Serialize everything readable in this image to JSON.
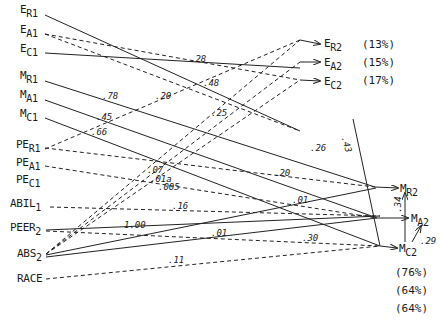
{
  "diagram": {
    "type": "path-diagram",
    "left_nodes": [
      {
        "id": "ER1",
        "base": "E",
        "sub": "R1",
        "x": 20,
        "y": 10
      },
      {
        "id": "EA1",
        "base": "E",
        "sub": "A1",
        "x": 20,
        "y": 30
      },
      {
        "id": "EC1",
        "base": "E",
        "sub": "C1",
        "x": 20,
        "y": 49
      },
      {
        "id": "MR1",
        "base": "M",
        "sub": "R1",
        "x": 20,
        "y": 76
      },
      {
        "id": "MA1",
        "base": "M",
        "sub": "A1",
        "x": 20,
        "y": 95
      },
      {
        "id": "MC1",
        "base": "M",
        "sub": "C1",
        "x": 20,
        "y": 114
      },
      {
        "id": "PER1",
        "base": "PE",
        "sub": "R1",
        "x": 16,
        "y": 145
      },
      {
        "id": "PEA1",
        "base": "PE",
        "sub": "A1",
        "x": 16,
        "y": 163
      },
      {
        "id": "PEC1",
        "base": "PE",
        "sub": "C1",
        "x": 16,
        "y": 180
      },
      {
        "id": "ABIL1",
        "base": "ABIL",
        "sub": "1",
        "x": 10,
        "y": 203
      },
      {
        "id": "PEER2",
        "base": "PEER",
        "sub": "2",
        "x": 10,
        "y": 228
      },
      {
        "id": "ABS2",
        "base": "ABS",
        "sub": "2",
        "x": 17,
        "y": 253
      },
      {
        "id": "RACE",
        "base": "RACE",
        "sub": "",
        "x": 17,
        "y": 276
      }
    ],
    "right_nodes": [
      {
        "id": "ER2",
        "base": "E",
        "sub": "R2",
        "x": 324,
        "y": 39,
        "variance": "(13%)"
      },
      {
        "id": "EA2",
        "base": "E",
        "sub": "A2",
        "x": 324,
        "y": 58,
        "variance": "(15%)"
      },
      {
        "id": "EC2",
        "base": "E",
        "sub": "C2",
        "x": 324,
        "y": 77,
        "variance": "(17%)"
      },
      {
        "id": "MR2",
        "base": "M",
        "sub": "R2",
        "x": 400,
        "y": 185
      },
      {
        "id": "MA2",
        "base": "M",
        "sub": "A2",
        "x": 410,
        "y": 214
      },
      {
        "id": "MC2",
        "base": "M",
        "sub": "C2",
        "x": 399,
        "y": 245
      }
    ],
    "variance_explained": {
      "E": [
        "(13%)",
        "(15%)",
        "(17%)"
      ],
      "M": [
        "(76%)",
        "(64%)",
        "(64%)"
      ]
    },
    "coefficients": [
      {
        "label": ".28",
        "x": 197,
        "y": 59
      },
      {
        "label": ".48",
        "x": 205,
        "y": 80
      },
      {
        "label": ".20",
        "x": 157,
        "y": 92
      },
      {
        "label": ".78",
        "x": 103,
        "y": 93
      },
      {
        "label": ".25",
        "x": 213,
        "y": 110
      },
      {
        "label": ".45",
        "x": 97,
        "y": 113
      },
      {
        "label": ".66",
        "x": 91,
        "y": 129
      },
      {
        "label": ".26",
        "x": 313,
        "y": 146
      },
      {
        "label": ".07",
        "x": 148,
        "y": 167
      },
      {
        "label": ".01a",
        "x": 151,
        "y": 175
      },
      {
        "label": ".005",
        "x": 160,
        "y": 184
      },
      {
        "label": ".20",
        "x": 276,
        "y": 170
      },
      {
        "label": ".16",
        "x": 174,
        "y": 204
      },
      {
        "label": "1.00",
        "x": 124,
        "y": 224
      },
      {
        "label": ".01",
        "x": 294,
        "y": 197
      },
      {
        "label": ".01",
        "x": 212,
        "y": 231
      },
      {
        "label": ".30",
        "x": 302,
        "y": 236
      },
      {
        "label": ".11",
        "x": 170,
        "y": 257
      },
      {
        "label": ".43",
        "x": 342,
        "y": 142,
        "rotate": 75
      },
      {
        "label": ".34",
        "x": 394,
        "y": 199,
        "rotate": -90
      },
      {
        "label": ".29",
        "x": 422,
        "y": 239
      }
    ]
  }
}
